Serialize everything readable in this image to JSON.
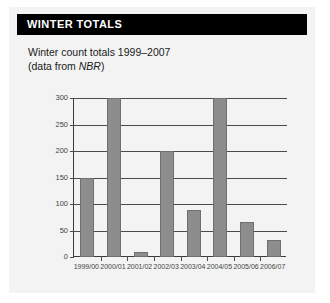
{
  "figure": {
    "header_title": "WINTER TOTALS",
    "caption_line1": "Winter count totals 1999–2007",
    "caption_line2_prefix": "(data from ",
    "caption_source": "NBR",
    "caption_line2_suffix": ")"
  },
  "colors": {
    "header_background": "#000000",
    "header_text": "#ffffff",
    "panel_background": "#f3f3f3",
    "bar_fill": "#8d8d8d",
    "bar_stroke": "#6f6f6f",
    "axis": "#3c3c3c",
    "gridline": "#4a4a4a",
    "tick_text": "#444444"
  },
  "chart_data": {
    "type": "bar",
    "title": "Winter count totals 1999–2007",
    "xlabel": "",
    "ylabel": "",
    "categories": [
      "1999/00",
      "2000/01",
      "2001/02",
      "2002/03",
      "2003/04",
      "2004/05",
      "2005/06",
      "2006/07"
    ],
    "values": [
      150,
      300,
      9,
      200,
      88,
      300,
      67,
      32
    ],
    "ylim": [
      0,
      300
    ],
    "yticks": [
      0,
      50,
      100,
      150,
      200,
      250,
      300
    ],
    "ytick_labels": [
      "0",
      "50",
      "100",
      "150",
      "200",
      "250",
      "300"
    ],
    "grid": true,
    "legend": null
  }
}
